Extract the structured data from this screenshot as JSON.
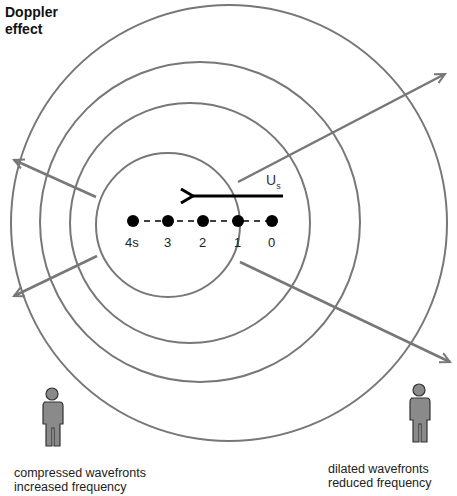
{
  "title": "Doppler effect",
  "source": {
    "velocity_label": "U",
    "velocity_subscript": "s",
    "positions": [
      {
        "label": "4s",
        "x": 133,
        "y": 221
      },
      {
        "label": "3",
        "x": 168,
        "y": 221
      },
      {
        "label": "2",
        "x": 203,
        "y": 221
      },
      {
        "label": "1",
        "x": 238,
        "y": 221
      },
      {
        "label": "0",
        "x": 272,
        "y": 221
      }
    ]
  },
  "wavefronts": [
    {
      "cx": 168,
      "cy": 225,
      "r": 72
    },
    {
      "cx": 190,
      "cy": 223,
      "r": 120
    },
    {
      "cx": 200,
      "cy": 222,
      "r": 160
    },
    {
      "cx": 229,
      "cy": 223,
      "r": 218
    }
  ],
  "observers": {
    "left": {
      "caption_line1": "compressed wavefronts",
      "caption_line2": "increased frequency"
    },
    "right": {
      "caption_line1": "dilated wavefronts",
      "caption_line2": "reduced frequency"
    }
  },
  "colors": {
    "line": "#777777",
    "source": "#000000",
    "figure_fill": "#8a8a8a"
  }
}
